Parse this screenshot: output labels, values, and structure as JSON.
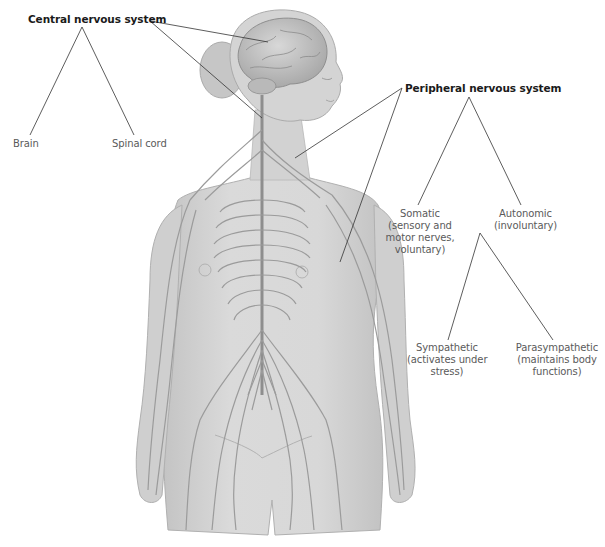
{
  "diagram": {
    "central": {
      "label": "Central nervous system",
      "children": [
        {
          "label": "Brain"
        },
        {
          "label": "Spinal cord"
        }
      ]
    },
    "peripheral": {
      "label": "Peripheral nervous system",
      "children": [
        {
          "label": "Somatic",
          "lines": [
            "Somatic",
            "(sensory and",
            "motor nerves,",
            "voluntary)"
          ]
        },
        {
          "label": "Autonomic",
          "lines": [
            "Autonomic",
            "(involuntary)"
          ],
          "children": [
            {
              "label": "Sympathetic",
              "lines": [
                "Sympathetic",
                "(activates under",
                "stress)"
              ]
            },
            {
              "label": "Parasympathetic",
              "lines": [
                "Parasympathetic",
                "(maintains body",
                "functions)"
              ]
            }
          ]
        }
      ]
    },
    "colors": {
      "skin": "#d6d6d6",
      "skin_shade": "#bdbdbd",
      "nerve": "#9a9a9a",
      "leader_line": "#333333",
      "bold_text": "#1a1a1a",
      "text": "#5a5a5a"
    }
  }
}
